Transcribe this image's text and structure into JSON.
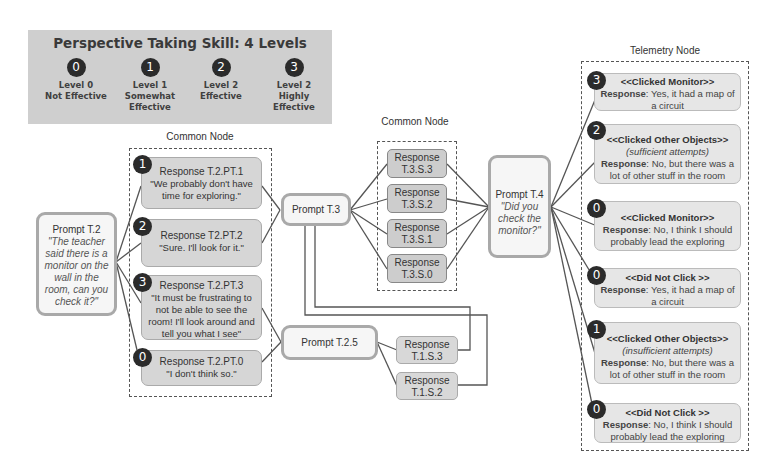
{
  "legend": {
    "title": "Perspective Taking Skill: 4 Levels",
    "levels": [
      {
        "badge": "0",
        "line1": "Level 0",
        "line2": "Not Effective",
        "line3": ""
      },
      {
        "badge": "1",
        "line1": "Level 1",
        "line2": "Somewhat",
        "line3": "Effective"
      },
      {
        "badge": "2",
        "line1": "Level 2",
        "line2": "Effective",
        "line3": ""
      },
      {
        "badge": "3",
        "line1": "Level 2",
        "line2": "Highly",
        "line3": "Effective"
      }
    ]
  },
  "common_node_1": {
    "caption": "Common Node",
    "responses": [
      {
        "badge": "1",
        "title": "Response T.2.PT.1",
        "lines": [
          "\"We probably don't have",
          "time for exploring.\""
        ]
      },
      {
        "badge": "2",
        "title": "Response T2.PT.2",
        "lines": [
          "\"Sure. I'll look for it.\""
        ]
      },
      {
        "badge": "3",
        "title": "Response T.2.PT.3",
        "lines": [
          "\"It must be frustrating to",
          "not be able to see the",
          "room! I'll look around and",
          "tell you what I see\""
        ]
      },
      {
        "badge": "0",
        "title": "Response T.2.PT.0",
        "lines": [
          "\"I don't think so.\""
        ]
      }
    ]
  },
  "prompt_t2": {
    "title": "Prompt T.2",
    "quote_lines": [
      "\"The teacher",
      "said there is a",
      "monitor on the",
      "wall in the",
      "room, can you",
      "check it?\""
    ]
  },
  "prompt_t3": {
    "title": "Prompt T.3"
  },
  "prompt_t25": {
    "title": "Prompt T.2.5"
  },
  "common_node_2": {
    "caption": "Common Node",
    "responses": [
      {
        "line1": "Response",
        "line2": "T.3.S.3"
      },
      {
        "line1": "Response",
        "line2": "T.3.S.2"
      },
      {
        "line1": "Response",
        "line2": "T.3.S.1"
      },
      {
        "line1": "Response",
        "line2": "T.3.S.0"
      }
    ]
  },
  "t1_responses": [
    {
      "line1": "Response",
      "line2": "T.1.S.3"
    },
    {
      "line1": "Response",
      "line2": "T.1.S.2"
    }
  ],
  "prompt_t4": {
    "title": "Prompt T.4",
    "quote_lines": [
      "\"Did you",
      "check the",
      "monitor?\""
    ]
  },
  "telemetry_node": {
    "caption": "Telemetry Node",
    "items": [
      {
        "badge": "3",
        "event": "<<Clicked Monitor>>",
        "attempt": "",
        "response_label": "Response",
        "response_lines": [
          ": Yes, it had a map of",
          "a circuit"
        ]
      },
      {
        "badge": "2",
        "event": "<<Clicked Other Objects>>",
        "attempt": "(sufficient attempts)",
        "response_label": "Response",
        "response_lines": [
          ": No, but there was a",
          "lot of other stuff in the room"
        ]
      },
      {
        "badge": "0",
        "event": "<<Clicked Monitor>>",
        "attempt": "",
        "response_label": "Response",
        "response_lines": [
          ": No, I think I should",
          "probably lead the exploring"
        ]
      },
      {
        "badge": "0",
        "event": "<<Did Not Click >>",
        "attempt": "",
        "response_label": "Response",
        "response_lines": [
          ": Yes, it had a map of",
          "a circuit"
        ]
      },
      {
        "badge": "1",
        "event": "<<Clicked Other Objects>>",
        "attempt": "(insufficient attempts)",
        "response_label": "Response",
        "response_lines": [
          ": No, but there was a",
          "lot of other stuff in the room"
        ]
      },
      {
        "badge": "0",
        "event": "<<Did Not Click >>",
        "attempt": "",
        "response_label": "Response",
        "response_lines": [
          ": No, I think I should",
          "probably lead the exploring"
        ]
      }
    ]
  }
}
